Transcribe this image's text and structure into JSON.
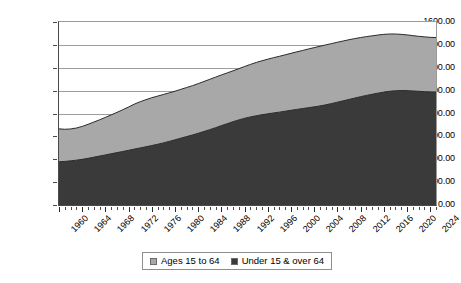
{
  "chart_data": {
    "type": "area",
    "stacked": true,
    "title": "",
    "xlabel": "",
    "ylabel": "",
    "ylim": [
      0,
      1600
    ],
    "ytick_step": 200,
    "ytick_labels": [
      "0.00",
      "200.00",
      "400.00",
      "600.00",
      "800.00",
      "1000.00",
      "1200.00",
      "1400.00",
      "1600.00"
    ],
    "ytick_values": [
      0,
      200,
      400,
      600,
      800,
      1000,
      1200,
      1400,
      1600
    ],
    "grid": "horizontal",
    "xlim": [
      1960,
      2025
    ],
    "x_tick_step": 4,
    "x_minor_tick_step": 1,
    "xtick_labels": [
      "1960",
      "1964",
      "1968",
      "1972",
      "1976",
      "1980",
      "1984",
      "1988",
      "1992",
      "1996",
      "2000",
      "2004",
      "2008",
      "2012",
      "2016",
      "2020",
      "2024"
    ],
    "xtick_values": [
      1960,
      1964,
      1968,
      1972,
      1976,
      1980,
      1984,
      1988,
      1992,
      1996,
      2000,
      2004,
      2008,
      2012,
      2016,
      2020,
      2024
    ],
    "legend_position": "bottom-center",
    "colors": {
      "ages_15_to_64": "#a8a8a8",
      "under_15_and_over_64": "#3a3a3a",
      "gridline": "#9d9d9d",
      "axis": "#4a4a4a",
      "series_outline": "#2b2b2b",
      "background": "#ffffff"
    },
    "x": [
      1960,
      1961,
      1962,
      1963,
      1964,
      1965,
      1966,
      1967,
      1968,
      1969,
      1970,
      1971,
      1972,
      1973,
      1974,
      1975,
      1976,
      1977,
      1978,
      1979,
      1980,
      1981,
      1982,
      1983,
      1984,
      1985,
      1986,
      1987,
      1988,
      1989,
      1990,
      1991,
      1992,
      1993,
      1994,
      1995,
      1996,
      1997,
      1998,
      1999,
      2000,
      2001,
      2002,
      2003,
      2004,
      2005,
      2006,
      2007,
      2008,
      2009,
      2010,
      2011,
      2012,
      2013,
      2014,
      2015,
      2016,
      2017,
      2018,
      2019,
      2020,
      2021,
      2022,
      2023,
      2024,
      2025
    ],
    "series": [
      {
        "name": "Under 15 & over 64",
        "color": "#3a3a3a",
        "values": [
          378,
          381,
          386,
          392,
          399,
          408,
          418,
          428,
          438,
          448,
          458,
          468,
          478,
          489,
          499,
          509,
          520,
          531,
          543,
          556,
          570,
          584,
          598,
          612,
          627,
          643,
          659,
          676,
          694,
          711,
          728,
          744,
          758,
          770,
          780,
          789,
          797,
          805,
          812,
          820,
          828,
          836,
          843,
          851,
          858,
          866,
          876,
          887,
          899,
          911,
          923,
          935,
          947,
          958,
          968,
          978,
          987,
          994,
          999,
          1001,
          1000,
          997,
          994,
          991,
          989,
          988
        ]
      },
      {
        "name": "Ages 15 to 64",
        "color": "#a8a8a8",
        "values": [
          288,
          281,
          279,
          281,
          288,
          297,
          307,
          317,
          328,
          340,
          352,
          365,
          379,
          393,
          404,
          412,
          418,
          421,
          423,
          424,
          425,
          427,
          429,
          431,
          434,
          437,
          440,
          442,
          443,
          444,
          445,
          448,
          453,
          459,
          466,
          472,
          478,
          483,
          488,
          493,
          498,
          503,
          508,
          513,
          518,
          522,
          524,
          524,
          524,
          523,
          522,
          520,
          517,
          514,
          511,
          508,
          505,
          501,
          496,
          491,
          487,
          484,
          481,
          479,
          477,
          476
        ]
      }
    ],
    "totals": [
      666,
      662,
      665,
      673,
      687,
      705,
      725,
      745,
      766,
      788,
      810,
      833,
      857,
      882,
      903,
      921,
      938,
      952,
      966,
      980,
      995,
      1011,
      1027,
      1043,
      1061,
      1080,
      1099,
      1118,
      1137,
      1155,
      1173,
      1192,
      1211,
      1229,
      1246,
      1261,
      1275,
      1288,
      1300,
      1313,
      1326,
      1339,
      1351,
      1364,
      1376,
      1388,
      1400,
      1411,
      1423,
      1434,
      1445,
      1455,
      1464,
      1472,
      1479,
      1486,
      1492,
      1495,
      1495,
      1492,
      1487,
      1481,
      1475,
      1470,
      1466,
      1464
    ]
  },
  "legend": {
    "items": [
      {
        "label": "Ages 15 to 64",
        "swatch": "#a8a8a8"
      },
      {
        "label": "Under 15 & over 64",
        "swatch": "#3a3a3a"
      }
    ]
  }
}
